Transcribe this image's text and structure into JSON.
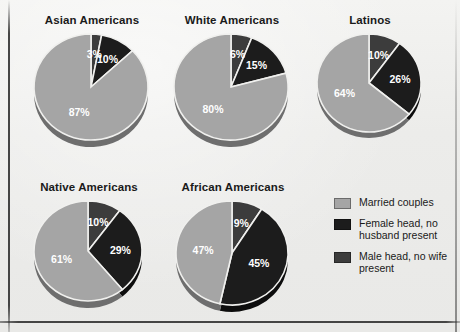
{
  "figure": {
    "background_color": "#ececeа",
    "has_border_frame": true
  },
  "legend": {
    "position": "bottom-right",
    "items": [
      {
        "label": "Married couples",
        "color": "#a5a5a5",
        "key": "married"
      },
      {
        "label": "Female head, no husband present",
        "color": "#1c1c1c",
        "key": "female_head"
      },
      {
        "label": "Male head, no wife present",
        "color": "#3c3c3c",
        "key": "male_head"
      }
    ]
  },
  "colors": {
    "married": "#a5a5a5",
    "female_head": "#1c1c1c",
    "male_head": "#3c3c3c",
    "married_shadow": "#6e6e6e",
    "female_head_shadow": "#0d0d0d",
    "male_head_shadow": "#242424",
    "label_text": "#ffffff",
    "title_text": "#1a1a1a"
  },
  "chart_data": {
    "type": "pie",
    "title": "",
    "subtitle": "",
    "unit": "percent",
    "legend_position": "bottom-right",
    "categories": [
      "Married couples",
      "Female head, no husband present",
      "Male head, no wife present"
    ],
    "slice_order_clockwise_from_top": [
      "Male head, no wife present",
      "Female head, no husband present",
      "Married couples"
    ],
    "charts": [
      {
        "title": "Asian Americans",
        "labels": [
          "3%",
          "10%",
          "87%"
        ],
        "values": [
          3,
          10,
          87
        ],
        "slices": [
          {
            "category": "Male head, no wife present",
            "value": 3,
            "label": "3%"
          },
          {
            "category": "Female head, no husband present",
            "value": 10,
            "label": "10%"
          },
          {
            "category": "Married couples",
            "value": 87,
            "label": "87%"
          }
        ]
      },
      {
        "title": "White Americans",
        "labels": [
          "6%",
          "15%",
          "80%"
        ],
        "values": [
          6,
          15,
          80
        ],
        "slices": [
          {
            "category": "Male head, no wife present",
            "value": 6,
            "label": "6%"
          },
          {
            "category": "Female head, no husband present",
            "value": 15,
            "label": "15%"
          },
          {
            "category": "Married couples",
            "value": 80,
            "label": "80%"
          }
        ]
      },
      {
        "title": "Latinos",
        "labels": [
          "10%",
          "26%",
          "64%"
        ],
        "values": [
          10,
          26,
          64
        ],
        "slices": [
          {
            "category": "Male head, no wife present",
            "value": 10,
            "label": "10%"
          },
          {
            "category": "Female head, no husband present",
            "value": 26,
            "label": "26%"
          },
          {
            "category": "Married couples",
            "value": 64,
            "label": "64%"
          }
        ]
      },
      {
        "title": "Native Americans",
        "labels": [
          "10%",
          "29%",
          "61%"
        ],
        "values": [
          10,
          29,
          61
        ],
        "slices": [
          {
            "category": "Male head, no wife present",
            "value": 10,
            "label": "10%"
          },
          {
            "category": "Female head, no husband present",
            "value": 29,
            "label": "29%"
          },
          {
            "category": "Married couples",
            "value": 61,
            "label": "61%"
          }
        ]
      },
      {
        "title": "African Americans",
        "labels": [
          "9%",
          "45%",
          "47%"
        ],
        "values": [
          9,
          45,
          47
        ],
        "slices": [
          {
            "category": "Male head, no wife present",
            "value": 9,
            "label": "9%"
          },
          {
            "category": "Female head, no husband present",
            "value": 45,
            "label": "45%"
          },
          {
            "category": "Married couples",
            "value": 47,
            "label": "47%"
          }
        ]
      }
    ]
  },
  "layout": {
    "pies": [
      {
        "left": 30,
        "top": 14,
        "radius": 57,
        "rx": 57,
        "ry": 53,
        "depth": 7
      },
      {
        "left": 170,
        "top": 14,
        "radius": 57,
        "rx": 57,
        "ry": 53,
        "depth": 7
      },
      {
        "left": 313,
        "top": 14,
        "radius": 52,
        "rx": 52,
        "ry": 49,
        "depth": 6
      },
      {
        "left": 30,
        "top": 181,
        "radius": 54,
        "rx": 54,
        "ry": 50,
        "depth": 7
      },
      {
        "left": 172,
        "top": 181,
        "radius": 56,
        "rx": 56,
        "ry": 52,
        "depth": 7
      }
    ]
  }
}
